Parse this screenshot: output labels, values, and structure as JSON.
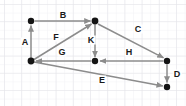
{
  "diagram": {
    "canvas": {
      "width": 186,
      "height": 106
    },
    "colors": {
      "background": "#ffffff",
      "grid_minor": "#f0f0f3",
      "grid_major": "#e4e4e8",
      "node_fill": "#141414",
      "edge_stroke": "#8c8c8c",
      "label_text": "#1a1a1a"
    },
    "grid": {
      "visible": true,
      "minor_spacing": 8.6,
      "major_spacing": 17.2,
      "origin_x": 4,
      "origin_y": 4
    },
    "nodes": [
      {
        "id": "n1",
        "name": "node-top-left",
        "x": 31,
        "y": 21,
        "r": 3.2
      },
      {
        "id": "n2",
        "name": "node-top-middle",
        "x": 95,
        "y": 21,
        "r": 3.4
      },
      {
        "id": "n3",
        "name": "node-bottom-left",
        "x": 31,
        "y": 61,
        "r": 3.4
      },
      {
        "id": "n4",
        "name": "node-center",
        "x": 95,
        "y": 61,
        "r": 3.2
      },
      {
        "id": "n5",
        "name": "node-right-upper",
        "x": 167,
        "y": 61,
        "r": 3.2
      },
      {
        "id": "n6",
        "name": "node-right-lower",
        "x": 167,
        "y": 87,
        "r": 3.2
      }
    ],
    "edges": [
      {
        "id": "A",
        "label": "A",
        "from": "n3",
        "to": "n1",
        "label_x": 25,
        "label_y": 42
      },
      {
        "id": "B",
        "label": "B",
        "from": "n1",
        "to": "n2",
        "label_x": 63,
        "label_y": 15
      },
      {
        "id": "C",
        "label": "C",
        "from": "n2",
        "to": "n5",
        "label_x": 138,
        "label_y": 29
      },
      {
        "id": "D",
        "label": "D",
        "from": "n5",
        "to": "n6",
        "label_x": 177,
        "label_y": 74
      },
      {
        "id": "E",
        "label": "E",
        "from": "n3",
        "to": "n6",
        "label_x": 102,
        "label_y": 80
      },
      {
        "id": "F",
        "label": "F",
        "from": "n3",
        "to": "n2",
        "label_x": 56,
        "label_y": 37
      },
      {
        "id": "G",
        "label": "G",
        "from": "n4",
        "to": "n3",
        "label_x": 62,
        "label_y": 52
      },
      {
        "id": "H",
        "label": "H",
        "from": "n5",
        "to": "n4",
        "label_x": 129,
        "label_y": 52
      },
      {
        "id": "K",
        "label": "K",
        "from": "n2",
        "to": "n4",
        "label_x": 91,
        "label_y": 40
      }
    ]
  }
}
